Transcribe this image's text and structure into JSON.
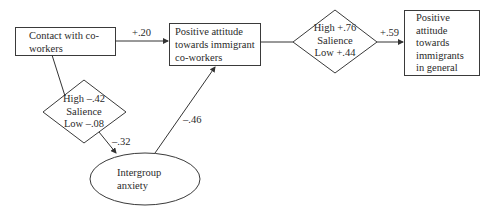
{
  "diagram": {
    "nodes": {
      "contact": {
        "label": "Contact with co-workers",
        "line1": "Contact with co-",
        "line2": "workers",
        "shape": "rectangle"
      },
      "attitude_coworkers": {
        "label": "Positive attitude towards immigrant co-workers",
        "line1": "Positive attitude",
        "line2": "towards immigrant",
        "line3": "co-workers",
        "shape": "rectangle"
      },
      "attitude_general": {
        "label": "Positive attitude towards immigrants in general",
        "line1": "Positive",
        "line2": "attitude",
        "line3": "towards",
        "line4": "immigrants",
        "line5": "in general",
        "shape": "rectangle"
      },
      "anxiety": {
        "label": "Intergroup anxiety",
        "line1": "Intergroup",
        "line2": "anxiety",
        "shape": "ellipse"
      },
      "moderator_left": {
        "shape": "diamond",
        "line1": "High –.42",
        "line2": "Salience",
        "line3": "Low –.08"
      },
      "moderator_right": {
        "shape": "diamond",
        "line1": "High +.76",
        "line2": "Salience",
        "line3": "Low +.44"
      }
    },
    "edges": [
      {
        "from": "contact",
        "to": "attitude_coworkers",
        "label": "+.20"
      },
      {
        "from": "attitude_coworkers",
        "to": "attitude_general",
        "label": "+.59",
        "via": "moderator_right"
      },
      {
        "from": "contact",
        "to": "anxiety",
        "label": "–.32",
        "via": "moderator_left"
      },
      {
        "from": "anxiety",
        "to": "attitude_coworkers",
        "label": "–.46"
      }
    ],
    "colors": {
      "stroke": "#3a3a3a",
      "text": "#2a2a2a",
      "background": "#ffffff"
    }
  }
}
